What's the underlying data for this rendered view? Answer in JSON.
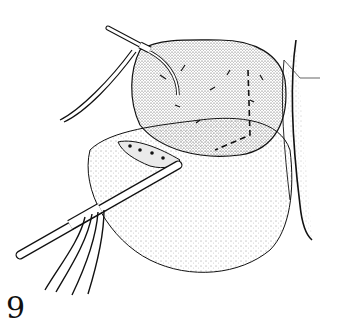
{
  "figure": {
    "number": "9",
    "colors": {
      "ink": "#111111",
      "background": "#ffffff"
    }
  }
}
